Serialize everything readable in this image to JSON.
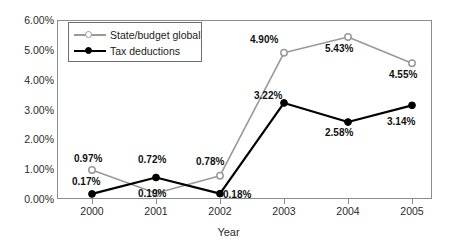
{
  "chart_data": {
    "type": "line",
    "title": "",
    "xlabel": "Year",
    "ylabel": "",
    "categories": [
      "2000",
      "2001",
      "2002",
      "2003",
      "2004",
      "2005"
    ],
    "x": [
      2000,
      2001,
      2002,
      2003,
      2004,
      2005
    ],
    "ylim": [
      0,
      6
    ],
    "y_tick_values": [
      0,
      1,
      2,
      3,
      4,
      5,
      6
    ],
    "y_tick_labels": [
      "0.00%",
      "1.00%",
      "2.00%",
      "3.00%",
      "4.00%",
      "5.00%",
      "6.00%"
    ],
    "grid": false,
    "legend_position": "top-left-inside",
    "series": [
      {
        "name": "State/budget global",
        "color": "#999999",
        "marker": "open-circle",
        "values": [
          0.97,
          0.19,
          0.78,
          4.9,
          5.43,
          4.55
        ],
        "value_labels": [
          "0.97%",
          "0.19%",
          "0.78%",
          "4.90%",
          "5.43%",
          "4.55%"
        ]
      },
      {
        "name": "Tax deductions",
        "color": "#000000",
        "marker": "filled-circle",
        "values": [
          0.17,
          0.72,
          0.18,
          3.22,
          2.58,
          3.14
        ],
        "value_labels": [
          "0.17%",
          "0.72%",
          "0.18%",
          "3.22%",
          "2.58%",
          "3.14%"
        ]
      }
    ],
    "annotations": [
      {
        "text": "0.97%",
        "series": "State/budget global",
        "category": "2000",
        "x": 74,
        "y": 154
      },
      {
        "text": "0.19%",
        "series": "State/budget global",
        "category": "2001",
        "x": 138,
        "y": 189
      },
      {
        "text": "0.78%",
        "series": "State/budget global",
        "category": "2002",
        "x": 196,
        "y": 157
      },
      {
        "text": "4.90%",
        "series": "State/budget global",
        "category": "2003",
        "x": 250,
        "y": 35
      },
      {
        "text": "5.43%",
        "series": "State/budget global",
        "category": "2004",
        "x": 325,
        "y": 44
      },
      {
        "text": "4.55%",
        "series": "State/budget global",
        "category": "2005",
        "x": 389,
        "y": 70
      },
      {
        "text": "0.17%",
        "series": "Tax deductions",
        "category": "2000",
        "x": 72,
        "y": 177
      },
      {
        "text": "0.72%",
        "series": "Tax deductions",
        "category": "2001",
        "x": 138,
        "y": 155
      },
      {
        "text": "0.18%",
        "series": "Tax deductions",
        "category": "2002",
        "x": 223,
        "y": 190
      },
      {
        "text": "3.22%",
        "series": "Tax deductions",
        "category": "2003",
        "x": 254,
        "y": 91
      },
      {
        "text": "2.58%",
        "series": "Tax deductions",
        "category": "2004",
        "x": 325,
        "y": 128
      },
      {
        "text": "3.14%",
        "series": "Tax deductions",
        "category": "2005",
        "x": 387,
        "y": 117
      }
    ]
  },
  "colors": {
    "series_gray": "#999999",
    "series_black": "#000000",
    "frame": "#8c8c8c",
    "text": "#1a1a1a",
    "background": "#ffffff"
  },
  "legend": {
    "items": [
      {
        "label": "State/budget global"
      },
      {
        "label": "Tax deductions"
      }
    ]
  }
}
